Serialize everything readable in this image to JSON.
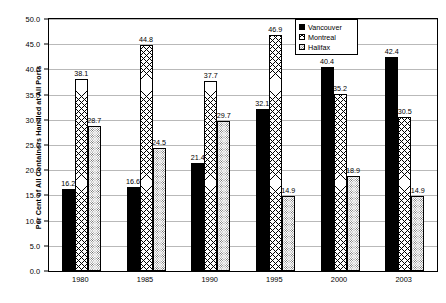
{
  "chart_data": {
    "type": "bar",
    "title": "",
    "xlabel": "",
    "ylabel": "Per Cent of All Containers Handled at All Ports",
    "categories": [
      "1980",
      "1985",
      "1990",
      "1995",
      "2000",
      "2003"
    ],
    "ylim": [
      0,
      50
    ],
    "ytick_step": 5,
    "yticks": [
      "0.0",
      "5.0",
      "10.0",
      "15.0",
      "20.0",
      "25.0",
      "30.0",
      "35.0",
      "40.0",
      "45.0",
      "50.0"
    ],
    "grid": true,
    "grid_axis": "y",
    "legend_position": "top-right",
    "series": [
      {
        "name": "Vancouver",
        "fill": "solid-black",
        "color": "#000000",
        "values": [
          16.2,
          16.6,
          21.4,
          32.1,
          40.4,
          42.4
        ],
        "labels": [
          "16.2",
          "16.6",
          "21.4",
          "32.1",
          "40.4",
          "42.4"
        ]
      },
      {
        "name": "Montreal",
        "fill": "crosshatch",
        "color": "#ffffff",
        "values": [
          38.1,
          44.8,
          37.7,
          46.9,
          35.2,
          30.5
        ],
        "labels": [
          "38.1",
          "44.8",
          "37.7",
          "46.9",
          "35.2",
          "30.5"
        ]
      },
      {
        "name": "Halifax",
        "fill": "dotted",
        "color": "#ffffff",
        "values": [
          28.7,
          24.5,
          29.7,
          14.9,
          18.9,
          14.9
        ],
        "labels": [
          "28.7",
          "24.5",
          "29.7",
          "14.9",
          "18.9",
          "14.9"
        ]
      }
    ]
  },
  "legend": {
    "items": [
      {
        "label": "Vancouver"
      },
      {
        "label": "Montreal"
      },
      {
        "label": "Halifax"
      }
    ]
  }
}
